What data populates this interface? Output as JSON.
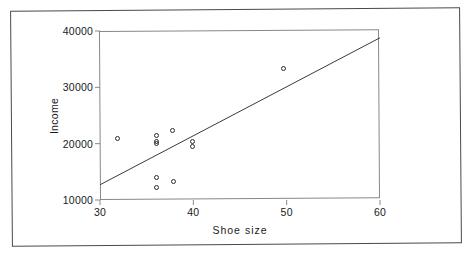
{
  "chart_data": {
    "type": "scatter",
    "title": "",
    "xlabel": "Shoe  size",
    "ylabel": "Income",
    "xlim": [
      30,
      60
    ],
    "ylim": [
      10000,
      40000
    ],
    "xticks": [
      30,
      40,
      50,
      60
    ],
    "xtick_labels": [
      "30",
      "40",
      "50",
      "60"
    ],
    "yticks": [
      10000,
      20000,
      30000,
      40000
    ],
    "ytick_labels": [
      "10000",
      "20000",
      "30000",
      "40000"
    ],
    "grid": false,
    "legend": null,
    "marker": "open-circle",
    "marker_color": "#2b2b2b",
    "points": [
      {
        "x": 31.9,
        "y": 20900
      },
      {
        "x": 36.0,
        "y": 21400
      },
      {
        "x": 36.0,
        "y": 20400
      },
      {
        "x": 36.0,
        "y": 20050
      },
      {
        "x": 37.8,
        "y": 22250
      },
      {
        "x": 39.9,
        "y": 20450
      },
      {
        "x": 39.9,
        "y": 19450
      },
      {
        "x": 36.1,
        "y": 14050
      },
      {
        "x": 36.1,
        "y": 12200
      },
      {
        "x": 37.9,
        "y": 13300
      },
      {
        "x": 49.7,
        "y": 33350
      }
    ],
    "trendline": {
      "type": "line",
      "x": [
        30,
        60
      ],
      "y": [
        12700,
        38800
      ],
      "color": "#3a3a3a"
    },
    "axis_color": "#888888",
    "frame_color": "#4a4a4a"
  }
}
